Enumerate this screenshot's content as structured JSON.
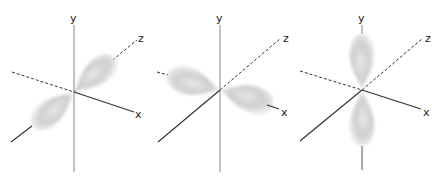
{
  "panels": [
    {
      "id": "pz",
      "orbital": "p_z",
      "origin": [
        74,
        92
      ],
      "axis_labels": {
        "x": "x",
        "y": "y",
        "z": "z"
      },
      "lobes_along": "z"
    },
    {
      "id": "px",
      "orbital": "p_x",
      "origin": [
        220,
        90
      ],
      "axis_labels": {
        "x": "x",
        "y": "y",
        "z": "z"
      },
      "lobes_along": "x"
    },
    {
      "id": "py",
      "orbital": "p_y",
      "origin": [
        362,
        90
      ],
      "axis_labels": {
        "x": "x",
        "y": "y",
        "z": "z"
      },
      "lobes_along": "y"
    }
  ],
  "colors": {
    "axis": "#333333",
    "y_axis": "#888888",
    "lobe": "#c8c8c8",
    "label": "#222222"
  }
}
